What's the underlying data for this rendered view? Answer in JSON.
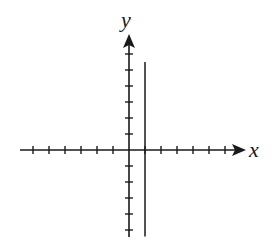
{
  "chart_data": {
    "type": "line",
    "title": "",
    "xlabel": "x",
    "ylabel": "y",
    "xlim": [
      -7,
      7
    ],
    "ylim": [
      -5,
      7
    ],
    "grid": false,
    "legend": null,
    "x_ticks": [
      -6,
      -5,
      -4,
      -3,
      -2,
      -1,
      1,
      2,
      3,
      4,
      5,
      6
    ],
    "y_ticks": [
      -5,
      -4,
      -3,
      -2,
      -1,
      1,
      2,
      3,
      4,
      5,
      6
    ],
    "tick_labels_shown": false,
    "series": [
      {
        "name": "x = 1",
        "kind": "vertical-line",
        "x": [
          1,
          1
        ],
        "y": [
          -5.4,
          5.5
        ]
      }
    ],
    "annotations": []
  },
  "colors": {
    "ink": "#1a1a1a",
    "background": "#ffffff"
  },
  "labels": {
    "x_axis": "x",
    "y_axis": "y"
  }
}
